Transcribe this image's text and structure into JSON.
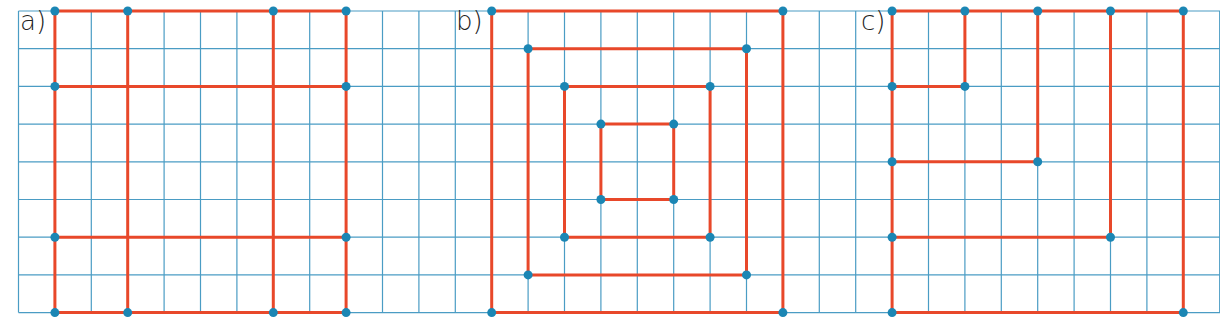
{
  "grid": {
    "x0": 18.5,
    "y0": 11,
    "cell_w": 36.4,
    "cell_h": 37.7,
    "cols": 33,
    "rows": 8,
    "line_color": "#4a9cc4"
  },
  "colors": {
    "segment": "#e8482a",
    "point": "#1b86b4"
  },
  "figures": [
    {
      "label": "a)",
      "label_pos": [
        20,
        6
      ],
      "segments": [
        [
          1,
          0,
          9,
          0
        ],
        [
          1,
          2,
          9,
          2
        ],
        [
          1,
          6,
          9,
          6
        ],
        [
          1,
          8,
          9,
          8
        ],
        [
          1,
          0,
          1,
          8
        ],
        [
          3,
          0,
          3,
          8
        ],
        [
          7,
          0,
          7,
          8
        ],
        [
          9,
          0,
          9,
          8
        ]
      ],
      "points": [
        [
          1,
          0
        ],
        [
          3,
          0
        ],
        [
          7,
          0
        ],
        [
          9,
          0
        ],
        [
          1,
          2
        ],
        [
          9,
          2
        ],
        [
          1,
          6
        ],
        [
          9,
          6
        ],
        [
          1,
          8
        ],
        [
          3,
          8
        ],
        [
          7,
          8
        ],
        [
          9,
          8
        ]
      ]
    },
    {
      "label": "b)",
      "label_pos": [
        456,
        6
      ],
      "segments": [
        [
          13,
          0,
          21,
          0
        ],
        [
          13,
          8,
          21,
          8
        ],
        [
          13,
          0,
          13,
          8
        ],
        [
          21,
          0,
          21,
          8
        ],
        [
          14,
          1,
          20,
          1
        ],
        [
          14,
          7,
          20,
          7
        ],
        [
          14,
          1,
          14,
          7
        ],
        [
          20,
          1,
          20,
          7
        ],
        [
          15,
          2,
          19,
          2
        ],
        [
          15,
          6,
          19,
          6
        ],
        [
          15,
          2,
          15,
          6
        ],
        [
          19,
          2,
          19,
          6
        ],
        [
          16,
          3,
          18,
          3
        ],
        [
          16,
          5,
          18,
          5
        ],
        [
          16,
          3,
          16,
          5
        ],
        [
          18,
          3,
          18,
          5
        ]
      ],
      "points": [
        [
          13,
          0
        ],
        [
          21,
          0
        ],
        [
          13,
          8
        ],
        [
          21,
          8
        ],
        [
          14,
          1
        ],
        [
          20,
          1
        ],
        [
          14,
          7
        ],
        [
          20,
          7
        ],
        [
          15,
          2
        ],
        [
          19,
          2
        ],
        [
          15,
          6
        ],
        [
          19,
          6
        ],
        [
          16,
          3
        ],
        [
          18,
          3
        ],
        [
          16,
          5
        ],
        [
          18,
          5
        ]
      ]
    },
    {
      "label": "c)",
      "label_pos": [
        861,
        6
      ],
      "segments": [
        [
          24,
          0,
          32,
          0
        ],
        [
          24,
          0,
          24,
          8
        ],
        [
          24,
          8,
          32,
          8
        ],
        [
          32,
          0,
          32,
          8
        ],
        [
          26,
          0,
          26,
          2
        ],
        [
          24,
          2,
          26,
          2
        ],
        [
          28,
          0,
          28,
          4
        ],
        [
          24,
          4,
          28,
          4
        ],
        [
          30,
          0,
          30,
          6
        ],
        [
          24,
          6,
          30,
          6
        ]
      ],
      "points": [
        [
          24,
          0
        ],
        [
          26,
          0
        ],
        [
          28,
          0
        ],
        [
          30,
          0
        ],
        [
          32,
          0
        ],
        [
          24,
          2
        ],
        [
          26,
          2
        ],
        [
          24,
          4
        ],
        [
          28,
          4
        ],
        [
          24,
          6
        ],
        [
          30,
          6
        ],
        [
          24,
          8
        ],
        [
          32,
          8
        ]
      ]
    }
  ]
}
